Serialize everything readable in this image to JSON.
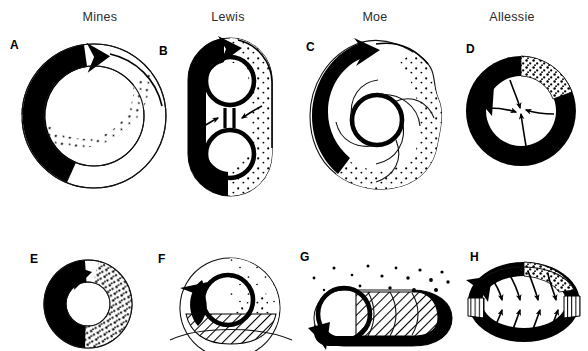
{
  "figure": {
    "background_color": "#ffffff",
    "ink_color": "#000000",
    "columns": [
      {
        "id": "mines",
        "label": "Mines",
        "center_x": 100
      },
      {
        "id": "lewis",
        "label": "Lewis",
        "center_x": 228
      },
      {
        "id": "moe",
        "label": "Moe",
        "center_x": 375
      },
      {
        "id": "allessie",
        "label": "Allessie",
        "center_x": 512
      }
    ],
    "panels": [
      {
        "id": "a",
        "letter": "A",
        "letter_x": 10,
        "letter_y": 38,
        "column": "mines",
        "row": "top",
        "description": "anatomic ring reentry with excitable gap",
        "fills": [
          "solid-black-wavefront",
          "stippled-refractory-tail",
          "open-lumen"
        ]
      },
      {
        "id": "b",
        "letter": "B",
        "letter_x": 159,
        "letter_y": 44,
        "column": "lewis",
        "row": "top",
        "description": "circus movement around two obstacles with line of block",
        "fills": [
          "solid-black-wavefront",
          "stippled-refractory-tail"
        ],
        "block_symbol": "double-bar"
      },
      {
        "id": "c",
        "letter": "C",
        "letter_x": 306,
        "letter_y": 40,
        "column": "moe",
        "row": "top",
        "description": "leading circle reentry with centripetal spiral wavelets",
        "fills": [
          "solid-black-wavefront",
          "stippled-refractory-tail"
        ]
      },
      {
        "id": "d",
        "letter": "D",
        "letter_x": 466,
        "letter_y": 42,
        "column": "allessie",
        "row": "top",
        "description": "leading circle with centripetal wavelets into refractory core",
        "fills": [
          "solid-black-ring",
          "stippled-refractory-tail"
        ],
        "centripetal_arrows": 4
      },
      {
        "id": "e",
        "letter": "E",
        "letter_x": 30,
        "letter_y": 252,
        "column": "mines",
        "row": "bottom",
        "description": "small functional reentry ring",
        "fills": [
          "solid-black-wavefront",
          "stippled-refractory-tail"
        ]
      },
      {
        "id": "f",
        "letter": "F",
        "letter_x": 158,
        "letter_y": 252,
        "column": "lewis",
        "row": "bottom",
        "description": "reentry adjacent to hatched anatomic barrier",
        "fills": [
          "solid-black-wavefront",
          "stippled-refractory-tail",
          "diagonal-hatch-barrier"
        ]
      },
      {
        "id": "g",
        "letter": "G",
        "letter_x": 300,
        "letter_y": 250,
        "column": "moe",
        "row": "bottom",
        "description": "figure-of-eight style circuit with hatched bands and dispersed stipple",
        "fills": [
          "solid-black-wavefront",
          "diagonal-hatch-bands",
          "scattered-stipple"
        ]
      },
      {
        "id": "h",
        "letter": "H",
        "letter_x": 470,
        "letter_y": 250,
        "column": "allessie",
        "row": "bottom",
        "description": "elliptical circuit with lateral vertical-hatch blocks and converging wavelets",
        "fills": [
          "solid-black-ring",
          "vertical-hatch-blocks",
          "stippled-refractory-tail"
        ],
        "converging_arrows": 8
      }
    ]
  }
}
